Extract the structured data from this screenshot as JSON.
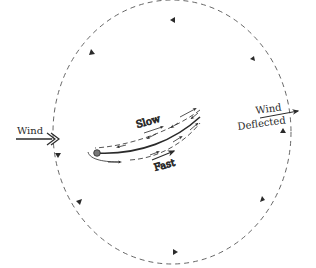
{
  "diagram": {
    "labels": {
      "wind_in": "Wind",
      "slow": "Slow",
      "fast": "Fast",
      "wind_deflected_line1": "Wind",
      "wind_deflected_line2": "Deflected"
    },
    "colors": {
      "stroke": "#2a2a2a",
      "dash": "#555555",
      "background": "#ffffff"
    }
  }
}
